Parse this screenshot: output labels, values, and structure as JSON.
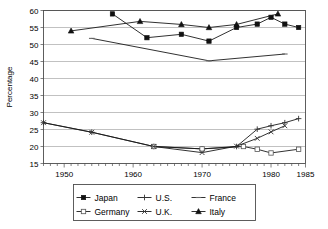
{
  "chart_data": {
    "type": "line",
    "title": "",
    "xlabel": "",
    "ylabel": "Percentage",
    "xlim": [
      1947,
      1985
    ],
    "ylim": [
      15,
      60
    ],
    "ytick_labels": [
      "15",
      "20",
      "25",
      "30",
      "35",
      "40",
      "45",
      "50",
      "55",
      "60"
    ],
    "yticks": [
      15,
      20,
      25,
      30,
      35,
      40,
      45,
      50,
      55,
      60
    ],
    "xtick_labels": [
      "1950",
      "1960",
      "1970",
      "1980",
      "1985"
    ],
    "xticks": [
      1950,
      1960,
      1970,
      1980,
      1985
    ],
    "minor_xtick_interval": 1,
    "grid": "horizontal",
    "legend_position": "bottom",
    "series": [
      {
        "name": "Japan",
        "marker": "filled-square",
        "x": [
          1957,
          1962,
          1967,
          1971,
          1975,
          1978,
          1980,
          1982,
          1984
        ],
        "values": [
          59,
          52,
          53,
          51,
          55,
          56,
          58,
          56,
          55
        ]
      },
      {
        "name": "U.S.",
        "marker": "plus",
        "x": [
          1947,
          1954,
          1963,
          1970,
          1975,
          1978,
          1980,
          1982,
          1984
        ],
        "values": [
          27,
          24.2,
          20,
          19.3,
          20,
          25.1,
          26.1,
          27,
          28.2
        ]
      },
      {
        "name": "France",
        "marker": "dash",
        "x": [
          1954,
          1971,
          1982
        ],
        "values": [
          51.8,
          45.2,
          47.2
        ]
      },
      {
        "name": "Germany",
        "marker": "open-square",
        "x": [
          1963,
          1970,
          1976,
          1978,
          1980,
          1984
        ],
        "values": [
          20,
          19.3,
          20,
          19.2,
          18.1,
          19.2
        ]
      },
      {
        "name": "U.K.",
        "marker": "x",
        "x": [
          1947,
          1954,
          1963,
          1970,
          1975,
          1978,
          1980,
          1982
        ],
        "values": [
          27,
          24.2,
          20,
          18.2,
          20.1,
          22.4,
          24.3,
          26.1
        ]
      },
      {
        "name": "Italy",
        "marker": "filled-triangle",
        "x": [
          1951,
          1961,
          1967,
          1971,
          1975,
          1981
        ],
        "values": [
          54,
          56.8,
          55.9,
          55,
          55.9,
          59
        ]
      }
    ]
  },
  "legend": {
    "entries": [
      {
        "label": "Japan",
        "marker": "filled-square"
      },
      {
        "label": "U.S.",
        "marker": "plus"
      },
      {
        "label": "France",
        "marker": "dash"
      },
      {
        "label": "Germany",
        "marker": "open-square"
      },
      {
        "label": "U.K.",
        "marker": "x"
      },
      {
        "label": "Italy",
        "marker": "filled-triangle"
      }
    ]
  },
  "colors": {
    "line": "#1a1a1a",
    "grid": "#a6a6a6",
    "frame": "#4d4d4d",
    "background": "#ffffff",
    "marker_fill": "#111111",
    "marker_open": "#ffffff"
  }
}
